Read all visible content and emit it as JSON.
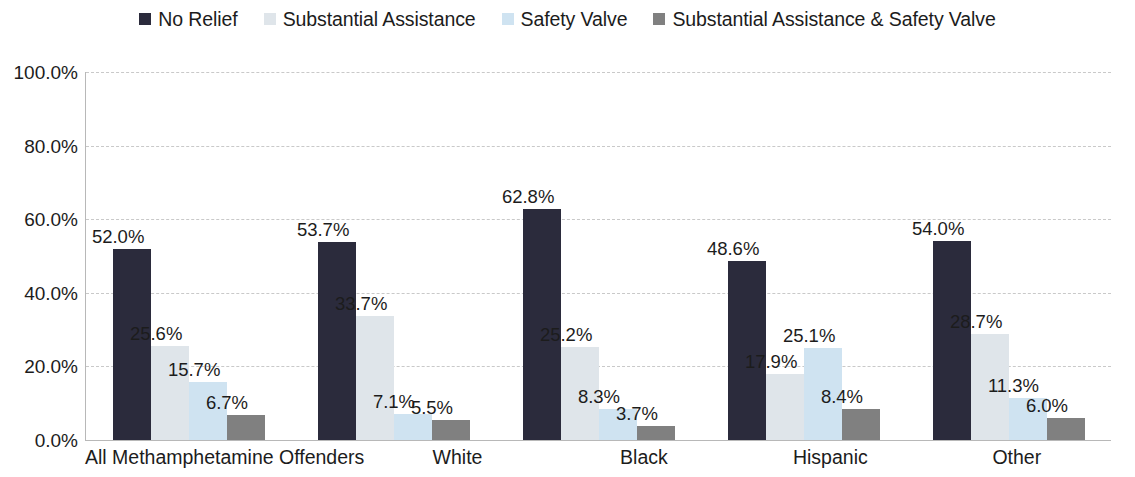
{
  "chart_data": {
    "type": "bar",
    "title": "",
    "subtitle": "",
    "xlabel": "",
    "ylabel": "",
    "ylim": [
      0,
      100
    ],
    "ytick_labels": [
      "100.0%",
      "80.0%",
      "60.0%",
      "40.0%",
      "20.0%",
      "0.0%"
    ],
    "ytick_values": [
      100,
      80,
      60,
      40,
      20,
      0
    ],
    "grid": true,
    "grid_axis": "y",
    "legend_position": "top-center",
    "value_suffix": "%",
    "categories": [
      "All Methamphetamine Offenders",
      "White",
      "Black",
      "Hispanic",
      "Other"
    ],
    "series": [
      {
        "name": "No Relief",
        "color": "#2b2b3c",
        "values": [
          52.0,
          53.7,
          62.8,
          48.6,
          54.0
        ],
        "labels": [
          "52.0%",
          "53.7%",
          "62.8%",
          "48.6%",
          "54.0%"
        ]
      },
      {
        "name": "Substantial Assistance",
        "color": "#dfe5ea",
        "values": [
          25.6,
          33.7,
          25.2,
          17.9,
          28.7
        ],
        "labels": [
          "25.6%",
          "33.7%",
          "25.2%",
          "17.9%",
          "28.7%"
        ]
      },
      {
        "name": "Safety Valve",
        "color": "#cfe3f1",
        "values": [
          15.7,
          7.1,
          8.3,
          25.1,
          11.3
        ],
        "labels": [
          "15.7%",
          "7.1%",
          "8.3%",
          "25.1%",
          "11.3%"
        ]
      },
      {
        "name": "Substantial Assistance & Safety Valve",
        "color": "#808080",
        "values": [
          6.7,
          5.5,
          3.7,
          8.4,
          6.0
        ],
        "labels": [
          "6.7%",
          "5.5%",
          "3.7%",
          "8.4%",
          "6.0%"
        ]
      }
    ]
  }
}
